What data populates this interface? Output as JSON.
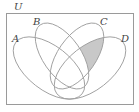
{
  "diagram": {
    "type": "venn",
    "universe_label": "U",
    "sets": [
      {
        "label": "A"
      },
      {
        "label": "B"
      },
      {
        "label": "C"
      },
      {
        "label": "D"
      }
    ],
    "shaded_region": "C ∩ D only (outside A and B)",
    "colors": {
      "outline": "#9a9a9a",
      "shade": "#c8c8c8",
      "background": "#ffffff"
    }
  }
}
